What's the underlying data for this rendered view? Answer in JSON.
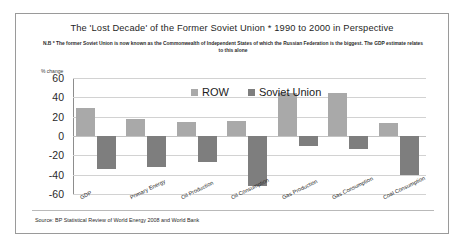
{
  "chart_data": {
    "type": "bar",
    "title": "The 'Lost Decade' of the Former Soviet Union * 1990 to 2000 in Perspective",
    "subtitle": "N.B * The former Soviet Union is now known as the Commonwealth of Independent States of which the Russian Federation is the biggest.  The GDP estimate relates to this alone",
    "xlabel": "",
    "ylabel": "% change",
    "ylim": [
      -60,
      60
    ],
    "yticks": [
      60,
      40,
      20,
      0,
      -20,
      -40,
      -60
    ],
    "grid": true,
    "legend_position": "top-center",
    "categories": [
      "GDP",
      "Primary Energy",
      "Oil Production",
      "Oil Consumption",
      "Gas Production",
      "Gas Consumption",
      "Coal Consumption"
    ],
    "series": [
      {
        "name": "ROW",
        "color": "#a9a9a9",
        "values": [
          29,
          18,
          14,
          16,
          45,
          44,
          13
        ]
      },
      {
        "name": "Soviet Union",
        "color": "#7e7e7e",
        "values": [
          -34,
          -32,
          -27,
          -52,
          -10,
          -13,
          -40
        ]
      }
    ],
    "source": "Source: BP Statistical Review of World Energy 2008 and World Bank"
  }
}
